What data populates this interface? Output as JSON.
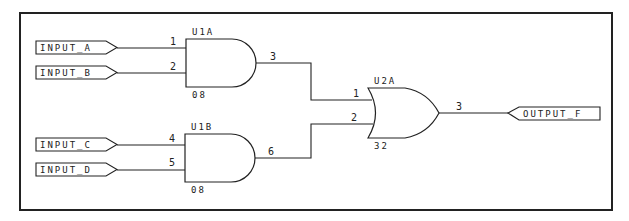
{
  "diagram": {
    "type": "logic-schematic",
    "inputs": [
      {
        "label": "INPUT_A"
      },
      {
        "label": "INPUT_B"
      },
      {
        "label": "INPUT_C"
      },
      {
        "label": "INPUT_D"
      }
    ],
    "output": {
      "label": "OUTPUT_F"
    },
    "gates": [
      {
        "ref": "U1A",
        "part": "08",
        "kind": "AND",
        "pins": {
          "in1": "1",
          "in2": "2",
          "out": "3"
        }
      },
      {
        "ref": "U1B",
        "part": "08",
        "kind": "AND",
        "pins": {
          "in1": "4",
          "in2": "5",
          "out": "6"
        }
      },
      {
        "ref": "U2A",
        "part": "32",
        "kind": "OR",
        "pins": {
          "in1": "1",
          "in2": "2",
          "out": "3"
        }
      }
    ]
  }
}
